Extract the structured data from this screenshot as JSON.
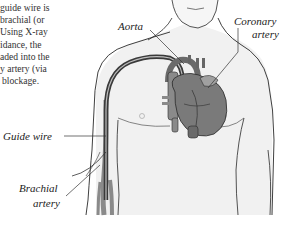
{
  "caption": {
    "lines": [
      "guide wire is",
      "brachial (or",
      "Using X-ray",
      "idance, the",
      "aded into the",
      "y artery (via",
      "blockage."
    ]
  },
  "labels": {
    "aorta": "Aorta",
    "coronary_line1": "Coronary",
    "coronary_line2": "artery",
    "guide_wire": "Guide wire",
    "brachial_line1": "Brachial",
    "brachial_line2": "artery"
  },
  "colors": {
    "outline": "#2a2a2a",
    "skin_shade": "#ececec",
    "heart_fill": "#7a7a7a",
    "wire": "#3a3a3a",
    "artery_fill": "#8a8a8a"
  }
}
